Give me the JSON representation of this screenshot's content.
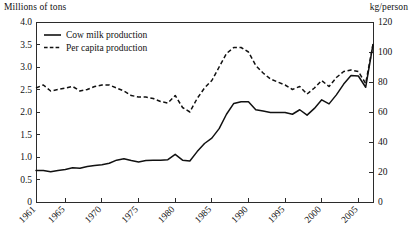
{
  "chart_data": {
    "type": "line",
    "title": "",
    "xlabel": "",
    "ylabel": "Millions of tons",
    "y2label": "kg/person",
    "left_axis": {
      "label": "Millions of tons",
      "min": 0,
      "max": 4.0,
      "ticks": [
        "0",
        "0.5",
        "1.0",
        "1.5",
        "2.0",
        "2.5",
        "3.0",
        "3.5",
        "4.0"
      ],
      "tick_values": [
        0,
        0.5,
        1.0,
        1.5,
        2.0,
        2.5,
        3.0,
        3.5,
        4.0
      ]
    },
    "right_axis": {
      "label": "kg/person",
      "min": 0,
      "max": 120,
      "ticks": [
        "0",
        "20",
        "40",
        "60",
        "80",
        "100",
        "120"
      ],
      "tick_values": [
        0,
        20,
        40,
        60,
        80,
        100,
        120
      ]
    },
    "x_axis": {
      "min": 1961,
      "max": 2007,
      "tick_labels": [
        "1961",
        "1965",
        "1970",
        "1975",
        "1980",
        "1985",
        "1990",
        "1995",
        "2000",
        "2005"
      ],
      "tick_values": [
        1961,
        1965,
        1970,
        1975,
        1980,
        1985,
        1990,
        1995,
        2000,
        2005
      ],
      "tick_label_rotation": -45
    },
    "grid": false,
    "legend_position": "top-left",
    "x": [
      1961,
      1962,
      1963,
      1964,
      1965,
      1966,
      1967,
      1968,
      1969,
      1970,
      1971,
      1972,
      1973,
      1974,
      1975,
      1976,
      1977,
      1978,
      1979,
      1980,
      1981,
      1982,
      1983,
      1984,
      1985,
      1986,
      1987,
      1988,
      1989,
      1990,
      1991,
      1992,
      1993,
      1994,
      1995,
      1996,
      1997,
      1998,
      1999,
      2000,
      2001,
      2002,
      2003,
      2004,
      2005,
      2006,
      2007
    ],
    "series": [
      {
        "name": "Cow milk production",
        "style": "solid",
        "axis": "left",
        "unit": "Millions of tons",
        "values": [
          0.7,
          0.7,
          0.67,
          0.7,
          0.72,
          0.76,
          0.75,
          0.79,
          0.81,
          0.83,
          0.86,
          0.93,
          0.96,
          0.92,
          0.89,
          0.92,
          0.93,
          0.93,
          0.94,
          1.06,
          0.93,
          0.91,
          1.12,
          1.3,
          1.42,
          1.63,
          1.95,
          2.19,
          2.23,
          2.23,
          2.05,
          2.02,
          1.99,
          1.99,
          1.99,
          1.95,
          2.05,
          1.93,
          2.08,
          2.27,
          2.18,
          2.38,
          2.62,
          2.81,
          2.8,
          2.55,
          3.5
        ]
      },
      {
        "name": "Per capita production",
        "style": "dashed",
        "axis": "right",
        "unit": "kg/person",
        "values": [
          76,
          78,
          74,
          75,
          76,
          77,
          74,
          75,
          77,
          78,
          78,
          76,
          74,
          71,
          70,
          70,
          69,
          67,
          66,
          71,
          63,
          60,
          69,
          76,
          81,
          90,
          99,
          103,
          103,
          100,
          91,
          86,
          82,
          80,
          78,
          75,
          77,
          72,
          76,
          81,
          77,
          83,
          87,
          88,
          87,
          79,
          105
        ]
      }
    ]
  },
  "legend": {
    "items": [
      {
        "label": "Cow milk production",
        "style": "solid"
      },
      {
        "label": "Per capita production",
        "style": "dashed"
      }
    ]
  }
}
